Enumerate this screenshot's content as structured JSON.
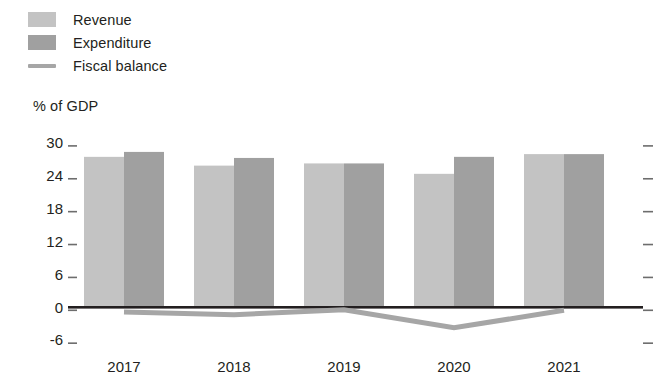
{
  "legend": {
    "items": [
      {
        "label": "Revenue",
        "type": "swatch",
        "color": "#c3c3c3"
      },
      {
        "label": "Expenditure",
        "type": "swatch",
        "color": "#a0a0a0"
      },
      {
        "label": "Fiscal balance",
        "type": "line",
        "color": "#a6a6a6"
      }
    ]
  },
  "axis_title": "% of GDP",
  "chart_data": {
    "type": "bar",
    "title": "",
    "subtitle": "",
    "xlabel": "",
    "ylabel": "% of GDP",
    "categories": [
      "2017",
      "2018",
      "2019",
      "2020",
      "2021"
    ],
    "yticks": [
      30,
      24,
      18,
      12,
      6,
      0,
      -6
    ],
    "ylim": [
      -6,
      30
    ],
    "grid": false,
    "legend_position": "top-left",
    "right_axis_ticks": [
      30,
      24,
      18,
      12,
      6,
      0,
      -6
    ],
    "series": [
      {
        "name": "Revenue",
        "type": "bar",
        "color": "#c3c3c3",
        "values": [
          27.4,
          25.8,
          26.2,
          24.3,
          27.9
        ]
      },
      {
        "name": "Expenditure",
        "type": "bar",
        "color": "#a0a0a0",
        "values": [
          28.3,
          27.2,
          26.2,
          27.4,
          27.9
        ]
      },
      {
        "name": "Fiscal balance",
        "type": "line",
        "color": "#a6a6a6",
        "values": [
          -0.9,
          -1.4,
          -0.5,
          -3.8,
          -0.6
        ]
      }
    ]
  }
}
